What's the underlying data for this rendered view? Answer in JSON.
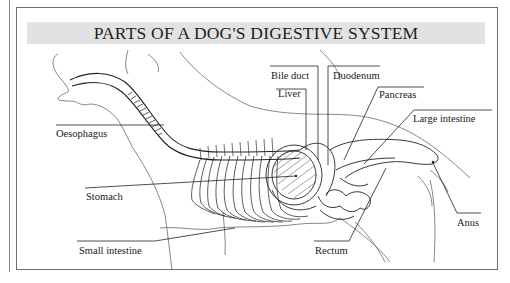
{
  "title": "PARTS OF A DOG'S DIGESTIVE SYSTEM",
  "labels": {
    "oesophagus": "Oesophagus",
    "stomach": "Stomach",
    "small_intestine": "Small intestine",
    "bile_duct": "Bile duct",
    "liver": "Liver",
    "duodenum": "Duodenum",
    "pancreas": "Pancreas",
    "large_intestine": "Large intestine",
    "anus": "Anus",
    "rectum": "Rectum"
  },
  "colors": {
    "frame": "#6e6e6e",
    "title_band": "#e2e2e2",
    "ink": "#1a1a1a"
  }
}
